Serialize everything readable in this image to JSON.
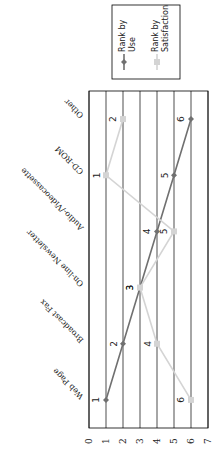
{
  "chart_data": {
    "type": "line",
    "orientation": "rotated-90-clockwise",
    "title": "",
    "xlabel": "",
    "ylabel": "",
    "categories": [
      "Web Page",
      "Broadcast Fax",
      "On-line Newsletter",
      "Audio-/Videocassette",
      "CD-ROM",
      "Other"
    ],
    "series": [
      {
        "name": "Rank by Use",
        "values": [
          1,
          2,
          3,
          4,
          5,
          6
        ],
        "color": "#707070",
        "marker": "diamond"
      },
      {
        "name": "Rank by Satisfaction",
        "values": [
          6,
          4,
          3,
          5,
          1,
          2
        ],
        "color": "#d4d4d4",
        "marker": "square"
      }
    ],
    "ylim": [
      0,
      7
    ],
    "yticks": [
      0,
      1,
      2,
      3,
      4,
      5,
      6,
      7
    ],
    "grid": true,
    "data_labels": true,
    "legend_position": "top-right"
  }
}
